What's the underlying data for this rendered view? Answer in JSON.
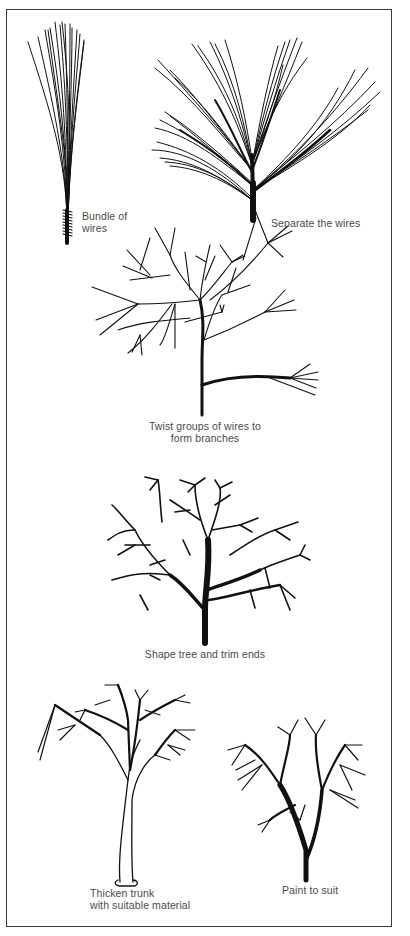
{
  "diagram": {
    "steps": [
      {
        "id": 1,
        "caption_lines": [
          "Bundle of",
          "wires"
        ]
      },
      {
        "id": 2,
        "caption_lines": [
          "Separate the wires"
        ]
      },
      {
        "id": 3,
        "caption_lines": [
          "Twist groups of wires to",
          "form branches"
        ]
      },
      {
        "id": 4,
        "caption_lines": [
          "Shape tree and trim ends"
        ]
      },
      {
        "id": 5,
        "caption_lines": [
          "Thicken trunk",
          "with suitable material"
        ]
      },
      {
        "id": 6,
        "caption_lines": [
          "Paint to suit"
        ]
      }
    ],
    "colors": {
      "ink": "#111111",
      "caption": "#4a4a4a",
      "border": "#3a3a3a",
      "background": "#ffffff"
    }
  }
}
